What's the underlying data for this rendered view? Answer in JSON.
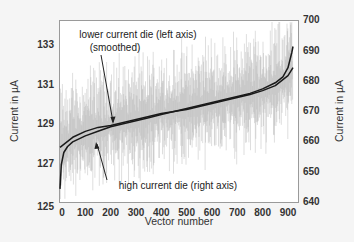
{
  "chart_data": {
    "type": "line",
    "title": "",
    "xlabel": "Vector number",
    "ylabel_left": "Current in µA",
    "ylabel_right": "Current in µA",
    "xlim": [
      0,
      930
    ],
    "ylim_left": [
      125,
      134
    ],
    "ylim_right": [
      640,
      700
    ],
    "x_ticks": [
      0,
      100,
      200,
      300,
      400,
      500,
      600,
      700,
      800,
      900
    ],
    "y_ticks_left": [
      125,
      127,
      129,
      131,
      133
    ],
    "y_ticks_right": [
      640,
      650,
      660,
      670,
      680,
      690,
      700
    ],
    "grid": false,
    "legend": null,
    "annotations": [
      {
        "text_line1": "lower current die (left axis)",
        "text_line2": "(smoothed)"
      },
      {
        "text": "high current die (right axis)"
      }
    ],
    "series": [
      {
        "name": "lower current die (left axis, smoothed)",
        "axis": "left",
        "x": [
          0,
          50,
          100,
          150,
          200,
          250,
          300,
          350,
          400,
          450,
          500,
          550,
          600,
          650,
          700,
          750,
          800,
          850,
          900,
          920
        ],
        "values": [
          127.8,
          128.3,
          128.6,
          128.8,
          128.9,
          129.05,
          129.2,
          129.35,
          129.5,
          129.6,
          129.7,
          129.85,
          130.0,
          130.15,
          130.3,
          130.45,
          130.65,
          130.9,
          131.4,
          131.8
        ]
      },
      {
        "name": "high current die (right axis)",
        "axis": "right",
        "x": [
          0,
          5,
          15,
          30,
          50,
          100,
          150,
          200,
          250,
          300,
          350,
          400,
          450,
          500,
          550,
          600,
          650,
          700,
          750,
          800,
          850,
          880,
          900,
          915,
          920
        ],
        "values": [
          644,
          652,
          656,
          658,
          659.5,
          661.5,
          663,
          664.5,
          665.5,
          666.5,
          667.5,
          668.5,
          669.5,
          670.5,
          671.5,
          672.5,
          673.5,
          674.5,
          675.5,
          677,
          679,
          681,
          684,
          689,
          691
        ]
      },
      {
        "name": "raw noisy data (light gray)",
        "axis": "left",
        "note": "unsmoothed measurements fluctuating roughly ±2 µA around the smoothed trend"
      }
    ]
  }
}
